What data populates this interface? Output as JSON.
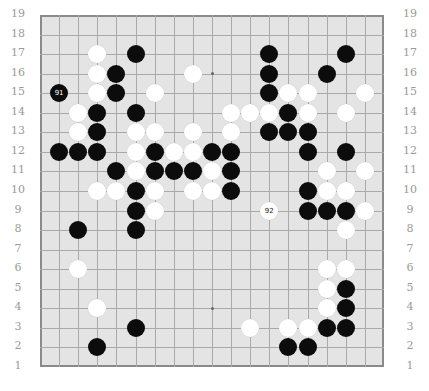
{
  "board": {
    "size": 19,
    "colors": {
      "background": "#e4e4e4",
      "line": "#a9a9a9",
      "border": "#8a8a8a",
      "label": "#9a9a9a"
    },
    "row_labels": [
      "19",
      "18",
      "17",
      "16",
      "15",
      "14",
      "13",
      "12",
      "11",
      "10",
      "9",
      "8",
      "7",
      "6",
      "5",
      "4",
      "3",
      "2",
      "1"
    ],
    "hoshi": [
      [
        4,
        4
      ],
      [
        10,
        4
      ],
      [
        16,
        4
      ],
      [
        4,
        10
      ],
      [
        10,
        10
      ],
      [
        16,
        10
      ],
      [
        4,
        16
      ],
      [
        10,
        16
      ],
      [
        16,
        16
      ]
    ],
    "black_stones": [
      [
        6,
        17
      ],
      [
        13,
        17
      ],
      [
        17,
        17
      ],
      [
        5,
        16
      ],
      [
        13,
        16
      ],
      [
        16,
        16
      ],
      [
        2,
        15
      ],
      [
        5,
        15
      ],
      [
        13,
        15
      ],
      [
        4,
        14
      ],
      [
        6,
        14
      ],
      [
        14,
        14
      ],
      [
        4,
        13
      ],
      [
        13,
        13
      ],
      [
        14,
        13
      ],
      [
        15,
        13
      ],
      [
        2,
        12
      ],
      [
        3,
        12
      ],
      [
        4,
        12
      ],
      [
        7,
        12
      ],
      [
        10,
        12
      ],
      [
        11,
        12
      ],
      [
        15,
        12
      ],
      [
        17,
        12
      ],
      [
        5,
        11
      ],
      [
        7,
        11
      ],
      [
        8,
        11
      ],
      [
        9,
        11
      ],
      [
        11,
        11
      ],
      [
        6,
        10
      ],
      [
        11,
        10
      ],
      [
        15,
        10
      ],
      [
        6,
        9
      ],
      [
        15,
        9
      ],
      [
        16,
        9
      ],
      [
        17,
        9
      ],
      [
        3,
        8
      ],
      [
        6,
        8
      ],
      [
        17,
        5
      ],
      [
        17,
        4
      ],
      [
        6,
        3
      ],
      [
        16,
        3
      ],
      [
        17,
        3
      ],
      [
        4,
        2
      ],
      [
        14,
        2
      ],
      [
        15,
        2
      ]
    ],
    "white_stones": [
      [
        4,
        17
      ],
      [
        4,
        16
      ],
      [
        9,
        16
      ],
      [
        4,
        15
      ],
      [
        7,
        15
      ],
      [
        14,
        15
      ],
      [
        15,
        15
      ],
      [
        18,
        15
      ],
      [
        3,
        14
      ],
      [
        11,
        14
      ],
      [
        12,
        14
      ],
      [
        13,
        14
      ],
      [
        15,
        14
      ],
      [
        17,
        14
      ],
      [
        3,
        13
      ],
      [
        6,
        13
      ],
      [
        7,
        13
      ],
      [
        9,
        13
      ],
      [
        11,
        13
      ],
      [
        6,
        12
      ],
      [
        8,
        12
      ],
      [
        9,
        12
      ],
      [
        6,
        11
      ],
      [
        10,
        11
      ],
      [
        16,
        11
      ],
      [
        18,
        11
      ],
      [
        4,
        10
      ],
      [
        5,
        10
      ],
      [
        7,
        10
      ],
      [
        9,
        10
      ],
      [
        10,
        10
      ],
      [
        16,
        10
      ],
      [
        17,
        10
      ],
      [
        7,
        9
      ],
      [
        13,
        9
      ],
      [
        18,
        9
      ],
      [
        17,
        8
      ],
      [
        3,
        6
      ],
      [
        16,
        6
      ],
      [
        17,
        6
      ],
      [
        16,
        5
      ],
      [
        4,
        4
      ],
      [
        16,
        4
      ],
      [
        12,
        3
      ],
      [
        14,
        3
      ],
      [
        15,
        3
      ]
    ],
    "numbered_moves": [
      {
        "number": "91",
        "color": "black",
        "col": 2,
        "row": 15
      },
      {
        "number": "92",
        "color": "white",
        "col": 13,
        "row": 9
      }
    ]
  }
}
